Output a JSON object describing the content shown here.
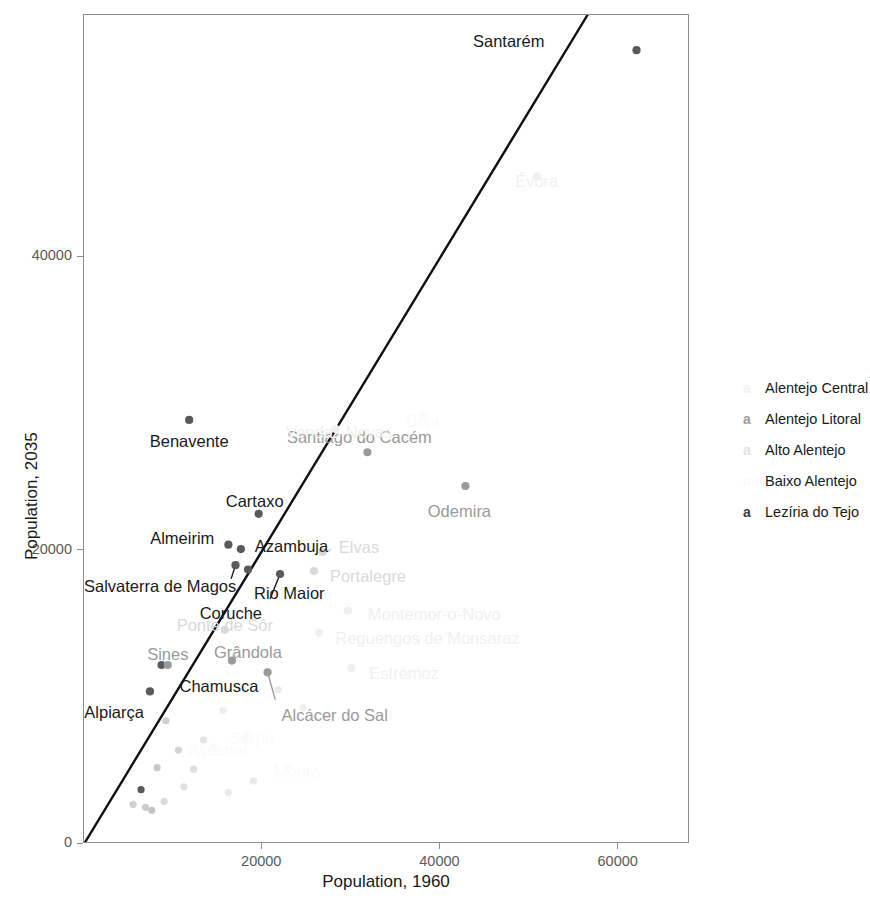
{
  "chart_data": {
    "type": "scatter",
    "title": "",
    "xlabel": "Population, 1960",
    "ylabel": "Population, 2035",
    "xlim": [
      0,
      68000
    ],
    "ylim": [
      0,
      56500
    ],
    "xticks": [
      20000,
      40000,
      60000
    ],
    "yticks": [
      0,
      20000,
      40000
    ],
    "xtick_labels": [
      "20000",
      "40000",
      "60000"
    ],
    "ytick_labels": [
      "0",
      "20000",
      "40000"
    ],
    "grid": false,
    "legend_position": "right",
    "legend_title": "",
    "reference_line": {
      "type": "identity",
      "label": "y = x",
      "color": "#111111",
      "width": 2.4,
      "from": [
        0,
        0
      ],
      "to": [
        56500,
        56500
      ]
    },
    "legend": [
      {
        "label": "Alentejo Central",
        "key": "a",
        "color": "#f2f2f2"
      },
      {
        "label": "Alentejo Litoral",
        "key": "a",
        "color": "#9a9a9a"
      },
      {
        "label": "Alto Alentejo",
        "key": "a",
        "color": "#e2e2e2"
      },
      {
        "label": "Baixo Alentejo",
        "key": "a",
        "color": "#fafafa"
      },
      {
        "label": "Lezíria do Tejo",
        "key": "a",
        "color": "#3d3d3d"
      }
    ],
    "series": [
      {
        "name": "Lezíria do Tejo",
        "color": "#5a5a5a",
        "label_color": "#1a1a1a",
        "points": [
          {
            "label": "Santarém",
            "x": 62000,
            "y": 54100,
            "label_dx": -92,
            "label_dy": -8,
            "anchor": "end",
            "leader": false
          },
          {
            "label": "Benavente",
            "x": 11800,
            "y": 28900,
            "label_dx": 0,
            "label_dy": 22,
            "anchor": "middle",
            "leader": false
          },
          {
            "label": "Cartaxo",
            "x": 19600,
            "y": 22500,
            "label_dx": -4,
            "label_dy": -12,
            "anchor": "middle",
            "leader": false
          },
          {
            "label": "Almeirim",
            "x": 16200,
            "y": 20400,
            "label_dx": -14,
            "label_dy": -6,
            "anchor": "end",
            "leader": false
          },
          {
            "label": "Azambuja",
            "x": 17600,
            "y": 20100,
            "label_dx": 14,
            "label_dy": -2,
            "anchor": "start",
            "leader": false
          },
          {
            "label": "Salvaterra de Magos",
            "x": 17000,
            "y": 19000,
            "label_dx": -8,
            "label_dy": 22,
            "anchor": "end",
            "leader": true
          },
          {
            "label": "Rio Maior",
            "x": 18400,
            "y": 18700,
            "label_dx": 6,
            "label_dy": 24,
            "anchor": "start",
            "leader": false
          },
          {
            "label": "Coruche",
            "x": 22000,
            "y": 18400,
            "label_dx": -18,
            "label_dy": 40,
            "anchor": "end",
            "leader": true
          },
          {
            "label": "Chamusca",
            "x": 8700,
            "y": 12200,
            "label_dx": 18,
            "label_dy": 22,
            "anchor": "start",
            "leader": false
          },
          {
            "label": "Alpiarça",
            "x": 7400,
            "y": 10400,
            "label_dx": -6,
            "label_dy": 22,
            "anchor": "end",
            "leader": false
          }
        ]
      },
      {
        "name": "Alentejo Litoral",
        "color": "#9a9a9a",
        "label_color": "#9a9a9a",
        "points": [
          {
            "label": "Santiago do Cacém",
            "x": 31800,
            "y": 26700,
            "label_dx": -8,
            "label_dy": -14,
            "anchor": "middle",
            "leader": false
          },
          {
            "label": "Odemira",
            "x": 42800,
            "y": 24400,
            "label_dx": -6,
            "label_dy": 26,
            "anchor": "middle",
            "leader": false
          },
          {
            "label": "Grândola",
            "x": 16600,
            "y": 12500,
            "label_dx": 16,
            "label_dy": -8,
            "anchor": "middle",
            "leader": false
          },
          {
            "label": "Sines",
            "x": 9400,
            "y": 12200,
            "label_dx": 0,
            "label_dy": -10,
            "anchor": "middle",
            "leader": false
          },
          {
            "label": "Alcácer do Sal",
            "x": 20600,
            "y": 11700,
            "label_dx": 14,
            "label_dy": 44,
            "anchor": "start",
            "leader": true
          }
        ]
      },
      {
        "name": "Alto Alentejo",
        "color": "#d9d9d9",
        "label_color": "#d9d9d9",
        "points": [
          {
            "label": "Elvas",
            "x": 26800,
            "y": 19900,
            "label_dx": 16,
            "label_dy": -4,
            "anchor": "start",
            "leader": true
          },
          {
            "label": "Portalegre",
            "x": 25800,
            "y": 18600,
            "label_dx": 16,
            "label_dy": 6,
            "anchor": "start",
            "leader": false
          },
          {
            "label": "Ponte de Sôr",
            "x": 15800,
            "y": 14600,
            "label_dx": 0,
            "label_dy": -4,
            "anchor": "middle",
            "leader": false
          }
        ]
      },
      {
        "name": "Alentejo Central",
        "color": "#f0f0f0",
        "label_color": "#f0f0f0",
        "points": [
          {
            "label": "Évora",
            "x": 50800,
            "y": 45500,
            "label_dx": 0,
            "label_dy": 6,
            "anchor": "middle",
            "leader": false
          },
          {
            "label": "Montemor-o-Novo",
            "x": 29600,
            "y": 15900,
            "label_dx": 20,
            "label_dy": 4,
            "anchor": "start",
            "leader": false
          },
          {
            "label": "Reguengos de Monsaraz",
            "x": 26400,
            "y": 14400,
            "label_dx": 16,
            "label_dy": 6,
            "anchor": "start",
            "leader": false
          },
          {
            "label": "Estremoz",
            "x": 30000,
            "y": 12000,
            "label_dx": 18,
            "label_dy": 6,
            "anchor": "start",
            "leader": false
          },
          {
            "label": "Vendas Novas",
            "x": 28200,
            "y": 28300,
            "label_dx": 4,
            "label_dy": 4,
            "anchor": "middle",
            "leader": false
          }
        ]
      },
      {
        "name": "Baixo Alentejo",
        "color": "#fafafa",
        "label_color": "#fafafa",
        "points": [
          {
            "label": "Beja",
            "x": 38000,
            "y": 29200,
            "label_dx": 0,
            "label_dy": 6,
            "anchor": "middle",
            "leader": false
          },
          {
            "label": "Serpa",
            "x": 18200,
            "y": 7400,
            "label_dx": 6,
            "label_dy": 4,
            "anchor": "middle",
            "leader": false
          },
          {
            "label": "Moura",
            "x": 22800,
            "y": 5200,
            "label_dx": 10,
            "label_dy": 4,
            "anchor": "middle",
            "leader": false
          },
          {
            "label": "Aljustrel",
            "x": 14600,
            "y": 6600,
            "label_dx": 4,
            "label_dy": 4,
            "anchor": "middle",
            "leader": false
          }
        ]
      }
    ],
    "unlabeled_points": [
      {
        "x": 9200,
        "y": 8400,
        "color": "#cfcfcf"
      },
      {
        "x": 10600,
        "y": 6400,
        "color": "#d4d4d4"
      },
      {
        "x": 8200,
        "y": 5200,
        "color": "#c9c9c9"
      },
      {
        "x": 6400,
        "y": 3700,
        "color": "#5a5a5a"
      },
      {
        "x": 5500,
        "y": 2700,
        "color": "#d0d0d0"
      },
      {
        "x": 6900,
        "y": 2500,
        "color": "#cccccc"
      },
      {
        "x": 7600,
        "y": 2300,
        "color": "#c4c4c4"
      },
      {
        "x": 9000,
        "y": 2900,
        "color": "#dcdcdc"
      },
      {
        "x": 11200,
        "y": 3900,
        "color": "#e0e0e0"
      },
      {
        "x": 12300,
        "y": 5100,
        "color": "#dedede"
      },
      {
        "x": 13400,
        "y": 7100,
        "color": "#e4e4e4"
      },
      {
        "x": 15600,
        "y": 9100,
        "color": "#ededed"
      },
      {
        "x": 21800,
        "y": 10500,
        "color": "#ebebeb"
      },
      {
        "x": 24600,
        "y": 9300,
        "color": "#eeeeee"
      },
      {
        "x": 19000,
        "y": 4300,
        "color": "#e8e8e8"
      },
      {
        "x": 16200,
        "y": 3500,
        "color": "#eaeaea"
      }
    ]
  }
}
